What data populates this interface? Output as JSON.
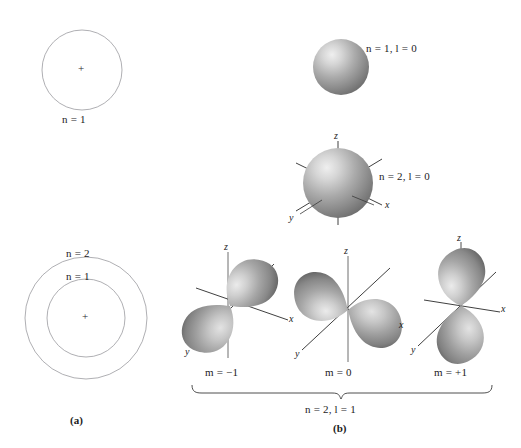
{
  "figure": {
    "background_color": "#ffffff",
    "ink_color": "#1c1c1c",
    "orbital_fill": "#8f8f8f",
    "orbital_highlight": "#e8e8e8",
    "circle_stroke": "#9a9aa0"
  },
  "panel_a": {
    "caption": "(a)",
    "shells": [
      {
        "label": "n = 1",
        "nucleus": "+"
      },
      {
        "label_outer": "n = 2",
        "label_inner": "n = 1",
        "nucleus": "+"
      }
    ],
    "top_shell_label": "n = 1",
    "bottom_outer_label": "n = 2",
    "bottom_inner_label": "n = 1",
    "nucleus_symbol": "+"
  },
  "panel_b": {
    "caption": "(b)",
    "orbitals": [
      {
        "name": "1s-orbital",
        "label": "n = 1,  l = 0",
        "type": "sphere",
        "axes": []
      },
      {
        "name": "2s-orbital",
        "label": "n = 2,  l = 0",
        "type": "sphere",
        "axes": [
          "z",
          "x",
          "y"
        ]
      },
      {
        "name": "2p-minus-one-orbital",
        "label": "m = −1",
        "type": "dumbbell",
        "axes": [
          "z",
          "x",
          "y"
        ]
      },
      {
        "name": "2p-zero-orbital",
        "label": "m = 0",
        "type": "dumbbell",
        "axes": [
          "z",
          "x",
          "y"
        ]
      },
      {
        "name": "2p-plus-one-orbital",
        "label": "m = +1",
        "type": "dumbbell",
        "axes": [
          "z",
          "x",
          "y"
        ]
      }
    ],
    "bracket_label": "n = 2,  l = 1",
    "axis_names": {
      "z": "z",
      "x": "x",
      "y": "y"
    }
  }
}
